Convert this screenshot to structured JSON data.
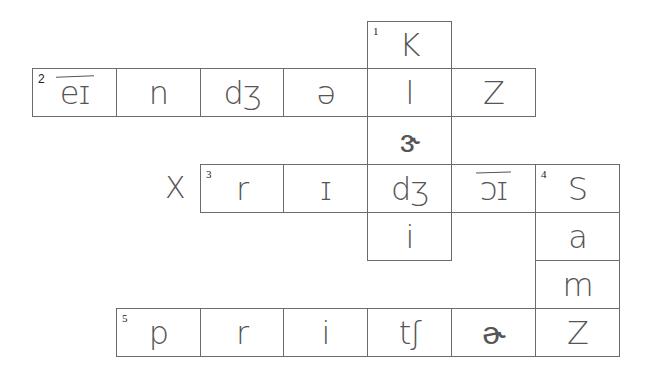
{
  "crossword": {
    "grid": {
      "col_x": [
        32,
        116,
        200,
        283,
        367,
        451,
        535,
        619
      ],
      "row_y": [
        21,
        68,
        116,
        164,
        212,
        260,
        308,
        356
      ],
      "line_color": "#6b6b6b"
    },
    "cells": [
      {
        "row": 0,
        "col": 4,
        "number": "1",
        "text": "K",
        "overline": false
      },
      {
        "row": 1,
        "col": 0,
        "number": "2",
        "text": "eɪ",
        "overline": true
      },
      {
        "row": 1,
        "col": 1,
        "number": "",
        "text": "n",
        "overline": false
      },
      {
        "row": 1,
        "col": 2,
        "number": "",
        "text": "dʒ",
        "overline": false
      },
      {
        "row": 1,
        "col": 3,
        "number": "",
        "text": "ə",
        "overline": false
      },
      {
        "row": 1,
        "col": 4,
        "number": "",
        "text": "l",
        "overline": false
      },
      {
        "row": 1,
        "col": 5,
        "number": "",
        "text": "Z",
        "overline": false
      },
      {
        "row": 2,
        "col": 4,
        "number": "",
        "text": "ɝ",
        "overline": false
      },
      {
        "row": 3,
        "col": 2,
        "number": "3",
        "text": "r",
        "overline": false
      },
      {
        "row": 3,
        "col": 3,
        "number": "",
        "text": "ɪ",
        "overline": false
      },
      {
        "row": 3,
        "col": 4,
        "number": "",
        "text": "dʒ",
        "overline": false
      },
      {
        "row": 3,
        "col": 5,
        "number": "",
        "text": "ɔɪ",
        "overline": true
      },
      {
        "row": 3,
        "col": 6,
        "number": "4",
        "text": "S",
        "overline": false
      },
      {
        "row": 4,
        "col": 4,
        "number": "",
        "text": "i",
        "overline": false
      },
      {
        "row": 4,
        "col": 6,
        "number": "",
        "text": "a",
        "overline": false
      },
      {
        "row": 5,
        "col": 6,
        "number": "",
        "text": "m",
        "overline": false
      },
      {
        "row": 6,
        "col": 1,
        "number": "5",
        "text": "p",
        "overline": false
      },
      {
        "row": 6,
        "col": 2,
        "number": "",
        "text": "r",
        "overline": false
      },
      {
        "row": 6,
        "col": 3,
        "number": "",
        "text": "i",
        "overline": false
      },
      {
        "row": 6,
        "col": 4,
        "number": "",
        "text": "tʃ",
        "overline": false
      },
      {
        "row": 6,
        "col": 5,
        "number": "",
        "text": "ɚ",
        "overline": false
      },
      {
        "row": 6,
        "col": 6,
        "number": "",
        "text": "Z",
        "overline": false
      }
    ],
    "annotations": [
      {
        "text": "X",
        "x": 165,
        "y": 170
      }
    ]
  }
}
